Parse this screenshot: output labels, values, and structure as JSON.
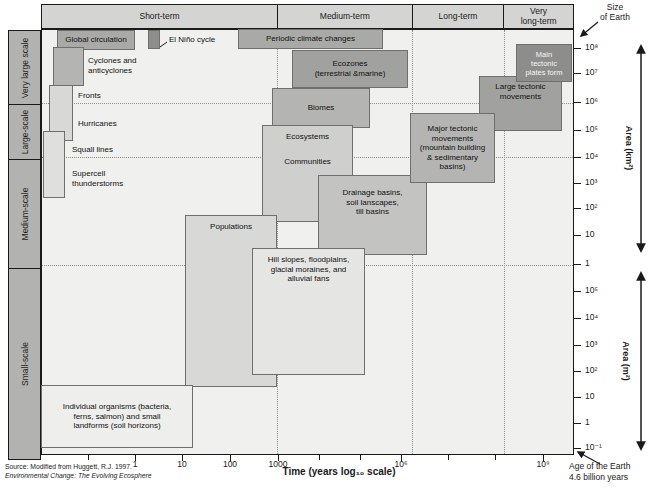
{
  "header": {
    "columns": [
      {
        "label": "Short-term"
      },
      {
        "label": "Medium-term"
      },
      {
        "label": "Long-term"
      },
      {
        "label": "Very\nlong-term"
      }
    ]
  },
  "sidebar": {
    "rows": [
      {
        "label": "Very large scale"
      },
      {
        "label": "Large-scale"
      },
      {
        "label": "Medium-scale"
      },
      {
        "label": "Small-scale"
      }
    ]
  },
  "boxes": {
    "global_circulation": {
      "label": "Global circulation"
    },
    "el_nino": {
      "label": "El Niño cycle"
    },
    "cyclones": {
      "label": "Cyclones and\nanticyclones"
    },
    "fronts": {
      "label": "Fronts"
    },
    "hurricanes": {
      "label": "Hurricanes"
    },
    "squall_lines": {
      "label": "Squall lines"
    },
    "supercell": {
      "label": "Supercell\nthunderstorms"
    },
    "periodic": {
      "label": "Periodic climate changes"
    },
    "ecozones": {
      "label": "Ecozones\n(terrestrial &marine)"
    },
    "biomes": {
      "label": "Biomes"
    },
    "ecosystems": {
      "label": "Ecosystems"
    },
    "communities": {
      "label": "Communities"
    },
    "drainage": {
      "label": "Drainage basins,\nsoil lanscapes,\ntill basins"
    },
    "populations": {
      "label": "Populations"
    },
    "hill_slopes": {
      "label": "Hill slopes, floodplains,\nglacial moraines, and\nalluvial fans"
    },
    "individual_organisms": {
      "label": "Individual organisms (bacteria,\nferns, salmon) and small\nlandforms (soil horizons)"
    },
    "major_tectonic": {
      "label": "Major tectonic\nmovements\n(mountain building\n& sedimentary\nbasins)"
    },
    "large_tectonic": {
      "label": "Large tectonic\nmovements"
    },
    "main_tectonic": {
      "label": "Main\ntectonic\nplates form"
    }
  },
  "axes": {
    "x": {
      "title": "Time (years log₁₀ scale)",
      "tick_labels": [
        "1",
        "10",
        "100",
        "1000",
        "10⁶",
        "10⁹"
      ]
    },
    "y_km": {
      "title": "Area (km²)",
      "tick_labels": [
        "10⁸",
        "10⁷",
        "10⁶",
        "10⁵",
        "10⁴",
        "10³",
        "10²",
        "10",
        "1"
      ]
    },
    "y_m": {
      "title": "Area (m²)",
      "tick_labels": [
        "10⁵",
        "10⁴",
        "10³",
        "10²",
        "10",
        "1",
        "10⁻¹"
      ]
    }
  },
  "annotations": {
    "size_of_earth": "Size\nof Earth",
    "age_of_earth": "Age of the Earth\n4.6 billion years",
    "source_line1": "Source: Modified from Huggett, R.J. 1997.",
    "source_line2": "Environmental Change: The Evolving Ecosphere"
  },
  "colors": {
    "plot_background": "#f0f0ee",
    "header_fill": "#d4d4d2",
    "sidebar_fill": "#b2b2b0",
    "box_darkest": "#8d8d8b",
    "box_dark": "#a1a19f",
    "box_medium": "#b4b4b2",
    "box_light": "#d8d8d6",
    "box_lightest": "#eeeeec",
    "line_color": "#1a1a1a"
  },
  "chart_data": {
    "type": "table",
    "xlabel": "Time (years log₁₀ scale)",
    "x_axis": {
      "scale": "log10",
      "tick_labels": [
        "1",
        "10",
        "100",
        "1000",
        "10⁶",
        "10⁹"
      ],
      "range_log10_years": [
        -2,
        9.7
      ],
      "column_bands": [
        "Short-term",
        "Medium-term",
        "Long-term",
        "Very long-term"
      ]
    },
    "y_axis": {
      "scale": "log10",
      "upper_section_label": "Area (km²)",
      "upper_ticks": [
        "10⁸",
        "10⁷",
        "10⁶",
        "10⁵",
        "10⁴",
        "10³",
        "10²",
        "10",
        "1"
      ],
      "lower_section_label": "Area (m²)",
      "lower_ticks": [
        "10⁵",
        "10⁴",
        "10³",
        "10²",
        "10",
        "1",
        "10⁻¹"
      ],
      "row_bands": [
        "Very large scale",
        "Large-scale",
        "Medium-scale",
        "Small-scale"
      ]
    },
    "columns": [
      "phenomenon",
      "time_log10_years_range",
      "area_log10_m2_range"
    ],
    "rows": [
      {
        "phenomenon": "Global circulation",
        "time_log10_years_range": [
          -1.7,
          0.0
        ],
        "area_log10_m2_range": [
          13.9,
          14.6
        ]
      },
      {
        "phenomenon": "El Niño cycle",
        "time_log10_years_range": [
          0.3,
          0.6
        ],
        "area_log10_m2_range": [
          14.0,
          14.6
        ]
      },
      {
        "phenomenon": "Cyclones and anticyclones",
        "time_log10_years_range": [
          -1.75,
          -1.1
        ],
        "area_log10_m2_range": [
          12.6,
          14.0
        ]
      },
      {
        "phenomenon": "Fronts",
        "time_log10_years_range": [
          -1.8,
          -1.3
        ],
        "area_log10_m2_range": [
          10.5,
          12.6
        ]
      },
      {
        "phenomenon": "Hurricanes",
        "time_log10_years_range": [
          -1.8,
          -1.3
        ],
        "area_log10_m2_range": [
          10.5,
          12.6
        ]
      },
      {
        "phenomenon": "Squall lines",
        "time_log10_years_range": [
          -2.0,
          -1.5
        ],
        "area_log10_m2_range": [
          8.4,
          10.9
        ]
      },
      {
        "phenomenon": "Supercell thunderstorms",
        "time_log10_years_range": [
          -2.0,
          -1.5
        ],
        "area_log10_m2_range": [
          8.4,
          10.9
        ]
      },
      {
        "phenomenon": "Individual organisms (bacteria, ferns, salmon) and small landforms (soil horizons)",
        "time_log10_years_range": [
          -2.0,
          1.2
        ],
        "area_log10_m2_range": [
          -1.1,
          1.5
        ]
      },
      {
        "phenomenon": "Populations",
        "time_log10_years_range": [
          1.0,
          3.0
        ],
        "area_log10_m2_range": [
          2.3,
          7.8
        ]
      },
      {
        "phenomenon": "Hill slopes, floodplains, glacial moraines, and alluvial fans",
        "time_log10_years_range": [
          2.4,
          5.1
        ],
        "area_log10_m2_range": [
          2.7,
          6.6
        ]
      },
      {
        "phenomenon": "Drainage basins, soil lanscapes, till basins",
        "time_log10_years_range": [
          4.0,
          6.6
        ],
        "area_log10_m2_range": [
          6.3,
          9.3
        ]
      },
      {
        "phenomenon": "Ecosystems",
        "time_log10_years_range": [
          2.7,
          4.8
        ],
        "area_log10_m2_range": [
          7.5,
          11.1
        ]
      },
      {
        "phenomenon": "Communities",
        "time_log10_years_range": [
          2.7,
          4.8
        ],
        "area_log10_m2_range": [
          7.5,
          11.1
        ]
      },
      {
        "phenomenon": "Biomes",
        "time_log10_years_range": [
          2.9,
          5.2
        ],
        "area_log10_m2_range": [
          11.0,
          12.5
        ]
      },
      {
        "phenomenon": "Ecozones (terrestrial & marine)",
        "time_log10_years_range": [
          3.3,
          6.2
        ],
        "area_log10_m2_range": [
          12.5,
          13.9
        ]
      },
      {
        "phenomenon": "Periodic climate changes",
        "time_log10_years_range": [
          2.0,
          5.6
        ],
        "area_log10_m2_range": [
          14.0,
          14.7
        ]
      },
      {
        "phenomenon": "Major tectonic movements (mountain building & sedimentary basins)",
        "time_log10_years_range": [
          6.2,
          8.0
        ],
        "area_log10_m2_range": [
          9.0,
          11.6
        ]
      },
      {
        "phenomenon": "Large tectonic movements",
        "time_log10_years_range": [
          7.7,
          9.4
        ],
        "area_log10_m2_range": [
          10.9,
          13.0
        ]
      },
      {
        "phenomenon": "Main tectonic plates form",
        "time_log10_years_range": [
          8.4,
          9.6
        ],
        "area_log10_m2_range": [
          12.7,
          14.1
        ]
      }
    ]
  }
}
